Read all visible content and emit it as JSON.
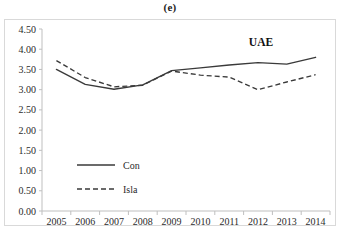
{
  "figure": {
    "panel_caption": "(e)",
    "series_title": "UAE"
  },
  "chart_data": {
    "type": "line",
    "title": "UAE",
    "subtitle": "(e)",
    "xlabel": "",
    "ylabel": "",
    "x": [
      2005,
      2006,
      2007,
      2008,
      2009,
      2010,
      2011,
      2012,
      2013,
      2014
    ],
    "categories": [
      "2005",
      "2006",
      "2007",
      "2008",
      "2009",
      "2010",
      "2011",
      "2012",
      "2013",
      "2014"
    ],
    "series": [
      {
        "name": "Con",
        "style": "solid",
        "color": "#3a3a3a",
        "values": [
          3.5,
          3.13,
          3.01,
          3.12,
          3.47,
          3.54,
          3.61,
          3.67,
          3.63,
          3.8
        ]
      },
      {
        "name": "Isla",
        "style": "dashed",
        "color": "#3a3a3a",
        "values": [
          3.72,
          3.3,
          3.07,
          3.11,
          3.46,
          3.36,
          3.31,
          3.0,
          3.19,
          3.37
        ]
      }
    ],
    "ylim": [
      0.0,
      4.5
    ],
    "ytick_labels": [
      "0.00",
      "0.50",
      "1.00",
      "1.50",
      "2.00",
      "2.50",
      "3.00",
      "3.50",
      "4.00",
      "4.50"
    ],
    "ytick_values": [
      0.0,
      0.5,
      1.0,
      1.5,
      2.0,
      2.5,
      3.0,
      3.5,
      4.0,
      4.5
    ],
    "xtick_labels": [
      "2005",
      "2006",
      "2007",
      "2008",
      "2009",
      "2010",
      "2011",
      "2012",
      "2013",
      "2014"
    ],
    "grid": false,
    "legend": {
      "position": "inside-left-lower",
      "entries": [
        {
          "label": "Con",
          "style": "solid"
        },
        {
          "label": "Isla",
          "style": "dashed"
        }
      ]
    }
  }
}
